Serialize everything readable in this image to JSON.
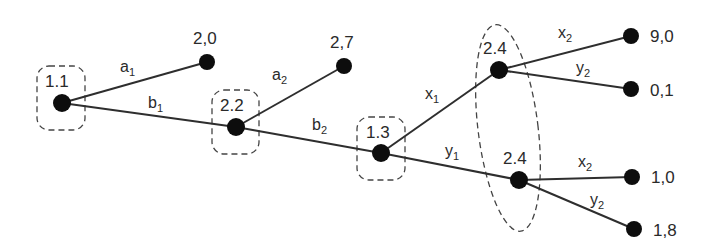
{
  "diagram": {
    "type": "extensive-form-game-tree",
    "decision_nodes": [
      {
        "id": "n1",
        "label": "1.1",
        "x": 62,
        "y": 103
      },
      {
        "id": "n2",
        "label": "2.2",
        "x": 236,
        "y": 127
      },
      {
        "id": "n3",
        "label": "1.3",
        "x": 381,
        "y": 153
      },
      {
        "id": "n4",
        "label": "2.4",
        "x": 499,
        "y": 70
      },
      {
        "id": "n5",
        "label": "2.4",
        "x": 519,
        "y": 180
      }
    ],
    "terminal_nodes": [
      {
        "id": "t1",
        "payoff": "2,0",
        "x": 207,
        "y": 62
      },
      {
        "id": "t2",
        "payoff": "2,7",
        "x": 344,
        "y": 66
      },
      {
        "id": "t3",
        "payoff": "9,0",
        "x": 631,
        "y": 36
      },
      {
        "id": "t4",
        "payoff": "0,1",
        "x": 631,
        "y": 89
      },
      {
        "id": "t5",
        "payoff": "1,0",
        "x": 632,
        "y": 177
      },
      {
        "id": "t6",
        "payoff": "1,8",
        "x": 634,
        "y": 229
      }
    ],
    "edges": [
      {
        "from": "n1",
        "to": "t1",
        "action": "a",
        "sub": "1"
      },
      {
        "from": "n1",
        "to": "n2",
        "action": "b",
        "sub": "1"
      },
      {
        "from": "n2",
        "to": "t2",
        "action": "a",
        "sub": "2"
      },
      {
        "from": "n2",
        "to": "n3",
        "action": "b",
        "sub": "2"
      },
      {
        "from": "n3",
        "to": "n4",
        "action": "x",
        "sub": "1"
      },
      {
        "from": "n3",
        "to": "n5",
        "action": "y",
        "sub": "1"
      },
      {
        "from": "n4",
        "to": "t3",
        "action": "x",
        "sub": "2"
      },
      {
        "from": "n4",
        "to": "t4",
        "action": "y",
        "sub": "2"
      },
      {
        "from": "n5",
        "to": "t5",
        "action": "x",
        "sub": "2"
      },
      {
        "from": "n5",
        "to": "t6",
        "action": "y",
        "sub": "2"
      }
    ],
    "information_sets": [
      {
        "label": "1.1",
        "members": [
          "n1"
        ]
      },
      {
        "label": "2.2",
        "members": [
          "n2"
        ]
      },
      {
        "label": "1.3",
        "members": [
          "n3"
        ]
      },
      {
        "label": "2.4",
        "members": [
          "n4",
          "n5"
        ]
      }
    ]
  },
  "labels": {
    "n1": "1.1",
    "n2": "2.2",
    "n3": "1.3",
    "n4": "2.4",
    "n5": "2.4",
    "t1": "2,0",
    "t2": "2,7",
    "t3": "9,0",
    "t4": "0,1",
    "t5": "1,0",
    "t6": "1,8",
    "e_a1": "a",
    "e_a1_sub": "1",
    "e_b1": "b",
    "e_b1_sub": "1",
    "e_a2": "a",
    "e_a2_sub": "2",
    "e_b2": "b",
    "e_b2_sub": "2",
    "e_x1": "x",
    "e_x1_sub": "1",
    "e_y1": "y",
    "e_y1_sub": "1",
    "e_x2u": "x",
    "e_x2u_sub": "2",
    "e_y2u": "y",
    "e_y2u_sub": "2",
    "e_x2l": "x",
    "e_x2l_sub": "2",
    "e_y2l": "y",
    "e_y2l_sub": "2"
  }
}
